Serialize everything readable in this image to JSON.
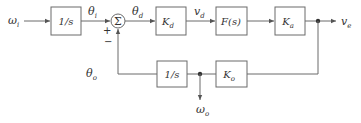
{
  "diagram": {
    "type": "control-system-block-diagram",
    "colors": {
      "line": "#6a6a6a",
      "text": "#333333",
      "background": "#ffffff"
    },
    "signals": {
      "input": {
        "main": "ω",
        "sub": "i"
      },
      "theta_i": {
        "main": "θ",
        "sub": "i"
      },
      "theta_d": {
        "main": "θ",
        "sub": "d"
      },
      "v_d": {
        "main": "v",
        "sub": "d"
      },
      "output": {
        "main": "v",
        "sub": "e"
      },
      "theta_o": {
        "main": "θ",
        "sub": "o"
      },
      "omega_o": {
        "main": "ω",
        "sub": "o"
      }
    },
    "blocks": {
      "integrator_in": {
        "main": "1/s",
        "sub": ""
      },
      "kd": {
        "main": "K",
        "sub": "d"
      },
      "filter": {
        "main": "F(s)",
        "sub": ""
      },
      "ka": {
        "main": "K",
        "sub": "a"
      },
      "integrator_fb": {
        "main": "1/s",
        "sub": ""
      },
      "ko": {
        "main": "K",
        "sub": "o"
      }
    },
    "summer": {
      "symbol": "Σ",
      "plus": "+",
      "minus": "−"
    }
  }
}
